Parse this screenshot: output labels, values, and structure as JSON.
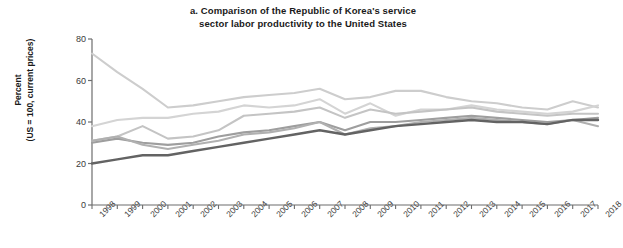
{
  "chart_data": {
    "type": "line",
    "title": "a. Comparison of the Republic of Korea's service sector labor productivity to the United States",
    "title_line1": "a. Comparison of the Republic of Korea's service",
    "title_line2": "sector labor productivity to the United States",
    "xlabel": "",
    "ylabel": "Percent (US = 100, current prices)",
    "ylabel_line1": "Percent",
    "ylabel_line2": "(US = 100, current prices)",
    "ylim": [
      0,
      80
    ],
    "yticks": [
      0,
      20,
      40,
      60,
      80
    ],
    "xlim": [
      1998,
      2018
    ],
    "grid": false,
    "legend": "none",
    "categories": [
      "1998",
      "1999",
      "2000",
      "2001",
      "2002",
      "2003",
      "2004",
      "2005",
      "2006",
      "2007",
      "2008",
      "2009",
      "2010",
      "2011",
      "2012",
      "2013",
      "2014",
      "2015",
      "2016",
      "2017",
      "2018"
    ],
    "series": [
      {
        "name": "series-1",
        "color": "#cdcdcd",
        "width": 2.1,
        "values": [
          73,
          64,
          56,
          47,
          48,
          50,
          52,
          53,
          54,
          56,
          51,
          52,
          55,
          55,
          52,
          50,
          49,
          47,
          46,
          50,
          47
        ]
      },
      {
        "name": "series-2",
        "color": "#d4d4d4",
        "width": 2.1,
        "values": [
          38,
          41,
          42,
          42,
          44,
          45,
          48,
          47,
          48,
          51,
          44,
          49,
          43,
          46,
          46,
          48,
          46,
          45,
          44,
          45,
          48
        ]
      },
      {
        "name": "series-3",
        "color": "#c4c4c4",
        "width": 2.1,
        "values": [
          31,
          33,
          38,
          32,
          33,
          36,
          43,
          44,
          45,
          47,
          42,
          46,
          44,
          45,
          46,
          47,
          45,
          44,
          43,
          44,
          44
        ]
      },
      {
        "name": "series-4",
        "color": "#9e9e9e",
        "width": 2.1,
        "values": [
          30,
          32,
          30,
          29,
          30,
          33,
          35,
          36,
          38,
          40,
          36,
          40,
          40,
          41,
          42,
          43,
          42,
          41,
          40,
          41,
          42
        ]
      },
      {
        "name": "series-5",
        "color": "#b0b0b0",
        "width": 2.1,
        "values": [
          31,
          33,
          29,
          27,
          29,
          31,
          34,
          35,
          37,
          40,
          34,
          37,
          38,
          40,
          41,
          42,
          41,
          40,
          39,
          41,
          38
        ]
      },
      {
        "name": "series-6",
        "color": "#636363",
        "width": 2.4,
        "values": [
          20,
          22,
          24,
          24,
          26,
          28,
          30,
          32,
          34,
          36,
          34,
          36,
          38,
          39,
          40,
          41,
          40,
          40,
          39,
          41,
          41
        ]
      }
    ]
  }
}
